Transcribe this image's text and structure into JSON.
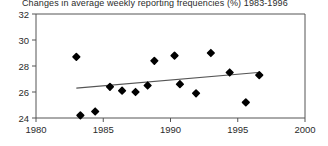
{
  "chart_data": {
    "type": "scatter",
    "title": "Changes in average weekly reporting frequencies (%) 1983-1996",
    "xlabel": "",
    "ylabel": "",
    "xlim": [
      1980,
      2000
    ],
    "ylim": [
      24,
      32
    ],
    "xticks": [
      1980,
      1985,
      1990,
      1995,
      2000
    ],
    "yticks": [
      24,
      26,
      28,
      30,
      32
    ],
    "grid": false,
    "legend": null,
    "marker_color": "#000000",
    "trendline_color": "#555555",
    "axis_color": "#555555",
    "points": [
      {
        "x": 1983.0,
        "y": 28.7
      },
      {
        "x": 1983.3,
        "y": 24.2
      },
      {
        "x": 1984.4,
        "y": 24.5
      },
      {
        "x": 1985.5,
        "y": 26.4
      },
      {
        "x": 1986.4,
        "y": 26.1
      },
      {
        "x": 1987.4,
        "y": 26.0
      },
      {
        "x": 1988.3,
        "y": 26.5
      },
      {
        "x": 1988.8,
        "y": 28.4
      },
      {
        "x": 1990.3,
        "y": 28.8
      },
      {
        "x": 1990.7,
        "y": 26.6
      },
      {
        "x": 1991.9,
        "y": 25.9
      },
      {
        "x": 1993.0,
        "y": 29.0
      },
      {
        "x": 1994.4,
        "y": 27.5
      },
      {
        "x": 1995.6,
        "y": 25.2
      },
      {
        "x": 1996.6,
        "y": 27.3
      }
    ],
    "trendline": {
      "x0": 1983.0,
      "y0": 26.3,
      "x1": 1996.5,
      "y1": 27.5
    }
  }
}
